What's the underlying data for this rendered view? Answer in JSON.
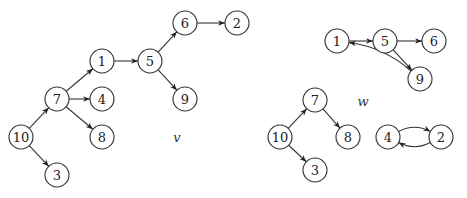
{
  "graphs": [
    {
      "label": "v",
      "label_pos": [
        177,
        137
      ],
      "nodes": [
        {
          "id": "10",
          "x": 21,
          "y": 137
        },
        {
          "id": "7",
          "x": 57,
          "y": 99
        },
        {
          "id": "1",
          "x": 102,
          "y": 61
        },
        {
          "id": "4",
          "x": 102,
          "y": 99
        },
        {
          "id": "8",
          "x": 102,
          "y": 137
        },
        {
          "id": "3",
          "x": 57,
          "y": 175
        },
        {
          "id": "5",
          "x": 150,
          "y": 61
        },
        {
          "id": "6",
          "x": 185,
          "y": 23
        },
        {
          "id": "2",
          "x": 237,
          "y": 23
        },
        {
          "id": "9",
          "x": 185,
          "y": 99
        }
      ],
      "edges": [
        {
          "from": "10",
          "to": "7"
        },
        {
          "from": "10",
          "to": "3"
        },
        {
          "from": "7",
          "to": "1"
        },
        {
          "from": "7",
          "to": "4"
        },
        {
          "from": "7",
          "to": "8"
        },
        {
          "from": "1",
          "to": "5"
        },
        {
          "from": "5",
          "to": "6"
        },
        {
          "from": "5",
          "to": "9"
        },
        {
          "from": "6",
          "to": "2"
        }
      ]
    },
    {
      "label": "w",
      "label_pos": [
        363,
        101
      ],
      "nodes": [
        {
          "id": "1",
          "x": 337,
          "y": 41
        },
        {
          "id": "5",
          "x": 385,
          "y": 41
        },
        {
          "id": "6",
          "x": 434,
          "y": 41
        },
        {
          "id": "9",
          "x": 420,
          "y": 79
        },
        {
          "id": "7",
          "x": 315,
          "y": 100
        },
        {
          "id": "10",
          "x": 280,
          "y": 137
        },
        {
          "id": "8",
          "x": 348,
          "y": 137
        },
        {
          "id": "3",
          "x": 315,
          "y": 170
        },
        {
          "id": "4",
          "x": 388,
          "y": 137
        },
        {
          "id": "2",
          "x": 441,
          "y": 137
        }
      ],
      "edges": [
        {
          "from": "1",
          "to": "5"
        },
        {
          "from": "5",
          "to": "6"
        },
        {
          "from": "5",
          "to": "9"
        },
        {
          "from": "9",
          "to": "1",
          "curve": 14
        },
        {
          "from": "10",
          "to": "7"
        },
        {
          "from": "10",
          "to": "3"
        },
        {
          "from": "7",
          "to": "8"
        },
        {
          "from": "4",
          "to": "2",
          "curve": -14
        },
        {
          "from": "2",
          "to": "4",
          "curve": -14
        }
      ]
    }
  ],
  "node_radius": 12,
  "colors": {
    "stroke": "#333333",
    "fill": "#ffffff",
    "text": "#222222"
  }
}
